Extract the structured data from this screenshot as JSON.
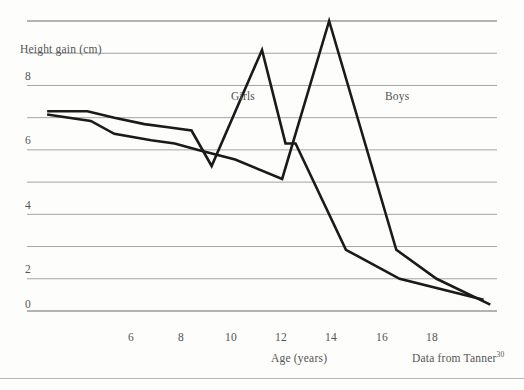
{
  "figure": {
    "background_color": "#fdfdfc",
    "line_color": "#1a1a1a",
    "grid_color": "#9a9a9a",
    "text_color": "#545454"
  },
  "chart_data": {
    "type": "line",
    "title": "",
    "xlabel": "Age (years)",
    "ylabel": "Height gain (cm)",
    "xlim": [
      5,
      19
    ],
    "ylim": [
      0,
      9
    ],
    "xticks": [
      6,
      8,
      10,
      12,
      14,
      16,
      18
    ],
    "xtick_labels": [
      "6",
      "8",
      "10",
      "12",
      "14",
      "16",
      "18"
    ],
    "yticks": [
      0,
      2,
      4,
      6,
      8
    ],
    "ytick_labels": [
      "0",
      "2",
      "4",
      "6",
      "8"
    ],
    "grid": "horizontal gridlines every 1 cm from 0 to 9",
    "grid_values": [
      0,
      1,
      2,
      3,
      4,
      5,
      6,
      7,
      8,
      9
    ],
    "legend_position": "inline labels next to curves",
    "annotations": [
      {
        "text": "Girls",
        "x": 11.1,
        "y": 6.6
      },
      {
        "text": "Boys",
        "x": 17.2,
        "y": 6.6
      }
    ],
    "source_note": "Data from Tanner",
    "source_superscript": "30",
    "series": [
      {
        "name": "Girls",
        "label": "Girls",
        "x": [
          5.6,
          6.8,
          7.6,
          8.5,
          9.2,
          9.9,
          10.5,
          12.0,
          12.7,
          13.0,
          14.5,
          16.1,
          18.6
        ],
        "values": [
          6.2,
          6.2,
          6.0,
          5.8,
          5.7,
          5.6,
          4.5,
          8.1,
          5.2,
          5.2,
          1.9,
          1.0,
          0.35
        ]
      },
      {
        "name": "Boys",
        "label": "Boys",
        "x": [
          5.6,
          6.9,
          7.6,
          8.7,
          9.4,
          10.1,
          11.2,
          12.6,
          14.0,
          16.0,
          17.2,
          18.8
        ],
        "values": [
          6.1,
          5.9,
          5.5,
          5.3,
          5.2,
          5.0,
          4.7,
          4.1,
          9.0,
          1.9,
          1.0,
          0.2
        ]
      }
    ]
  }
}
